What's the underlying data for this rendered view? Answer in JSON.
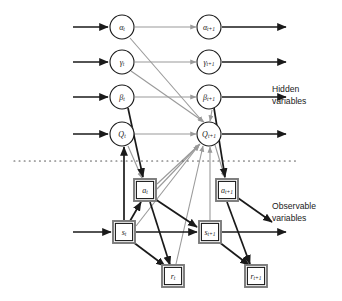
{
  "figure": {
    "type": "dynamic-bayesian-network",
    "background_color": "#ffffff",
    "width": 342,
    "height": 301
  },
  "legend": {
    "hidden_line1": "Hidden",
    "hidden_line2": "variables",
    "observable_line1": "Observable",
    "observable_line2": "variables"
  },
  "colors": {
    "node_stroke": "#1a1a1a",
    "node_fill": "#ffffff",
    "black_edge": "#1a1a1a",
    "gray_edge": "#9a9a9a",
    "box_outer": "#7a7a7a",
    "divider": "#555555",
    "text": "#1a1a1a"
  },
  "hidden_nodes": [
    {
      "id": "alpha_t",
      "base": "α",
      "sub": "t",
      "cx": 122,
      "cy": 27,
      "r": 12
    },
    {
      "id": "alpha_t1",
      "base": "α",
      "sub": "t+1",
      "cx": 209,
      "cy": 27,
      "r": 12
    },
    {
      "id": "gamma_t",
      "base": "γ",
      "sub": "t",
      "cx": 122,
      "cy": 62,
      "r": 12
    },
    {
      "id": "gamma_t1",
      "base": "γ",
      "sub": "t+1",
      "cx": 209,
      "cy": 62,
      "r": 12
    },
    {
      "id": "beta_t",
      "base": "β",
      "sub": "t",
      "cx": 122,
      "cy": 97,
      "r": 12
    },
    {
      "id": "beta_t1",
      "base": "β",
      "sub": "t+1",
      "cx": 209,
      "cy": 97,
      "r": 12
    },
    {
      "id": "Q_t",
      "base": "Q",
      "sub": "t",
      "cx": 122,
      "cy": 134,
      "r": 12
    },
    {
      "id": "Q_t1",
      "base": "Q",
      "sub": "t+1",
      "cx": 209,
      "cy": 134,
      "r": 12
    }
  ],
  "observable_nodes": [
    {
      "id": "a_t",
      "base": "a",
      "sub": "t",
      "cx": 145,
      "cy": 190,
      "w": 22,
      "h": 22
    },
    {
      "id": "a_t1",
      "base": "a",
      "sub": "t+1",
      "cx": 227,
      "cy": 190,
      "w": 22,
      "h": 22
    },
    {
      "id": "s_t",
      "base": "s",
      "sub": "t",
      "cx": 124,
      "cy": 232,
      "w": 22,
      "h": 22
    },
    {
      "id": "s_t1",
      "base": "s",
      "sub": "t+1",
      "cx": 210,
      "cy": 232,
      "w": 22,
      "h": 22
    },
    {
      "id": "r_t",
      "base": "r",
      "sub": "t",
      "cx": 173,
      "cy": 276,
      "w": 22,
      "h": 22
    },
    {
      "id": "r_t1",
      "base": "r",
      "sub": "t+1",
      "cx": 256,
      "cy": 276,
      "w": 22,
      "h": 22
    }
  ],
  "divider": {
    "y": 161,
    "x1": 14,
    "x2": 296,
    "style": "dotted"
  },
  "legend_positions": {
    "hidden_x": 272,
    "hidden_y1": 90,
    "hidden_y2": 102,
    "observable_x": 272,
    "observable_y1": 207,
    "observable_y2": 219
  },
  "edges_black": [
    {
      "from": "left-margin",
      "to": "alpha_t",
      "x1": 73,
      "y1": 27,
      "x2": 108,
      "y2": 27
    },
    {
      "from": "left-margin",
      "to": "gamma_t",
      "x1": 73,
      "y1": 62,
      "x2": 108,
      "y2": 62
    },
    {
      "from": "left-margin",
      "to": "beta_t",
      "x1": 73,
      "y1": 97,
      "x2": 108,
      "y2": 97
    },
    {
      "from": "left-margin",
      "to": "Q_t",
      "x1": 73,
      "y1": 134,
      "x2": 108,
      "y2": 134
    },
    {
      "from": "left-margin",
      "to": "s_t",
      "x1": 73,
      "y1": 232,
      "x2": 111,
      "y2": 232
    },
    {
      "from": "alpha_t1",
      "to": "right-margin",
      "x1": 222,
      "y1": 27,
      "x2": 286,
      "y2": 27
    },
    {
      "from": "gamma_t1",
      "to": "right-margin",
      "x1": 222,
      "y1": 62,
      "x2": 286,
      "y2": 62
    },
    {
      "from": "beta_t1",
      "to": "right-margin",
      "x1": 222,
      "y1": 97,
      "x2": 286,
      "y2": 97
    },
    {
      "from": "Q_t1",
      "to": "right-margin",
      "x1": 222,
      "y1": 134,
      "x2": 286,
      "y2": 134
    },
    {
      "from": "s_t1",
      "to": "right-margin",
      "x1": 222,
      "y1": 232,
      "x2": 286,
      "y2": 232
    },
    {
      "from": "beta_t",
      "to": "a_t",
      "x1": 128,
      "y1": 108,
      "x2": 143,
      "y2": 177
    },
    {
      "from": "s_t",
      "to": "Q_t",
      "x1": 124,
      "y1": 220,
      "x2": 124,
      "y2": 147
    },
    {
      "from": "s_t",
      "to": "a_t",
      "x1": 130,
      "y1": 221,
      "x2": 141,
      "y2": 202
    },
    {
      "from": "s_t",
      "to": "s_t1",
      "x1": 136,
      "y1": 232,
      "x2": 197,
      "y2": 232
    },
    {
      "from": "s_t",
      "to": "r_t",
      "x1": 133,
      "y1": 242,
      "x2": 165,
      "y2": 266
    },
    {
      "from": "a_t",
      "to": "s_t1",
      "x1": 155,
      "y1": 199,
      "x2": 197,
      "y2": 227
    },
    {
      "from": "a_t",
      "to": "r_t",
      "x1": 150,
      "y1": 202,
      "x2": 170,
      "y2": 265
    },
    {
      "from": "a_t1",
      "to": "margin-diag",
      "x1": 238,
      "y1": 198,
      "x2": 272,
      "y2": 222
    },
    {
      "from": "s_t1",
      "to": "r_t1",
      "x1": 219,
      "y1": 242,
      "x2": 249,
      "y2": 265
    },
    {
      "from": "a_t1",
      "to": "r_t1",
      "x1": 227,
      "y1": 202,
      "x2": 250,
      "y2": 264
    },
    {
      "from": "beta_t1",
      "to": "a_t1",
      "x1": 214,
      "y1": 108,
      "x2": 225,
      "y2": 177
    }
  ],
  "edges_gray": [
    {
      "from": "alpha_t",
      "to": "alpha_t1",
      "x1": 135,
      "y1": 27,
      "x2": 196,
      "y2": 27
    },
    {
      "from": "gamma_t",
      "to": "gamma_t1",
      "x1": 135,
      "y1": 62,
      "x2": 196,
      "y2": 62
    },
    {
      "from": "beta_t",
      "to": "beta_t1",
      "x1": 135,
      "y1": 97,
      "x2": 196,
      "y2": 97
    },
    {
      "from": "Q_t",
      "to": "Q_t1",
      "x1": 135,
      "y1": 134,
      "x2": 196,
      "y2": 134
    },
    {
      "from": "alpha_t",
      "to": "Q_t1",
      "x1": 130,
      "y1": 38,
      "x2": 203,
      "y2": 122
    },
    {
      "from": "gamma_t",
      "to": "Q_t1",
      "x1": 131,
      "y1": 71,
      "x2": 204,
      "y2": 122
    },
    {
      "from": "beta_t1",
      "to": "Q_t1",
      "x1": 212,
      "y1": 110,
      "x2": 210,
      "y2": 121
    },
    {
      "from": "a_t",
      "to": "Q_t1",
      "x1": 157,
      "y1": 184,
      "x2": 200,
      "y2": 144
    },
    {
      "from": "a_t",
      "to": "Q_t1",
      "x1": 157,
      "y1": 189,
      "x2": 199,
      "y2": 145
    },
    {
      "from": "s_t",
      "to": "Q_t1",
      "x1": 136,
      "y1": 226,
      "x2": 199,
      "y2": 145
    },
    {
      "from": "s_t1",
      "to": "Q_t1",
      "x1": 210,
      "y1": 220,
      "x2": 210,
      "y2": 147
    },
    {
      "from": "r_t",
      "to": "Q_t1",
      "x1": 176,
      "y1": 264,
      "x2": 203,
      "y2": 146
    },
    {
      "from": "Q_t",
      "to": "a_t",
      "x1": 128,
      "y1": 146,
      "x2": 142,
      "y2": 178
    },
    {
      "from": "Q_t1",
      "to": "a_t1",
      "x1": 215,
      "y1": 145,
      "x2": 225,
      "y2": 178
    }
  ]
}
